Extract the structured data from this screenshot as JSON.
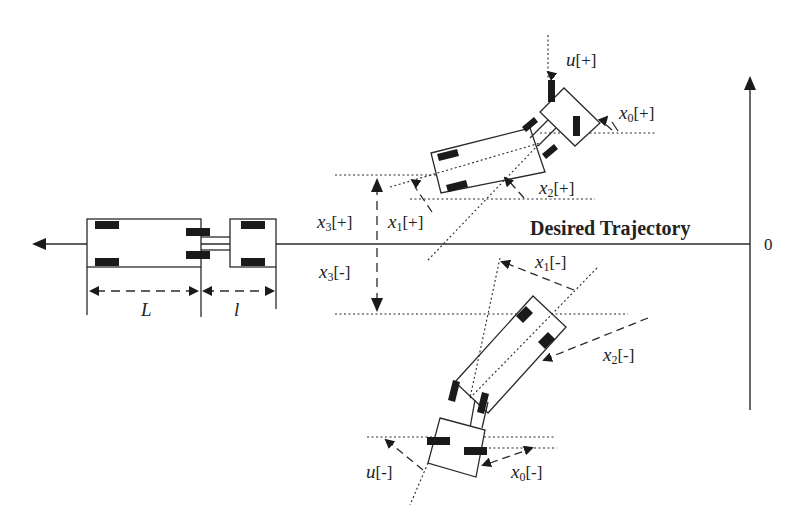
{
  "diagram": {
    "title": "Desired Trajectory",
    "origin_label": "0",
    "colors": {
      "stroke": "#2a2a2a",
      "wheel": "#1a1a1a",
      "background": "#ffffff"
    },
    "dimensions": {
      "trailer_length": "L",
      "hitch_length": "l"
    },
    "labels": {
      "u_pos": {
        "var": "u",
        "sub": "",
        "sign": "[+]"
      },
      "x0_pos": {
        "var": "x",
        "sub": "0",
        "sign": "[+]"
      },
      "x2_pos": {
        "var": "x",
        "sub": "2",
        "sign": "[+]"
      },
      "x3_pos": {
        "var": "x",
        "sub": "3",
        "sign": "[+]"
      },
      "x1_pos": {
        "var": "x",
        "sub": "1",
        "sign": "[+]"
      },
      "x3_neg": {
        "var": "x",
        "sub": "3",
        "sign": "[-]"
      },
      "x1_neg": {
        "var": "x",
        "sub": "1",
        "sign": "[-]"
      },
      "x2_neg": {
        "var": "x",
        "sub": "2",
        "sign": "[-]"
      },
      "u_neg": {
        "var": "u",
        "sub": "",
        "sign": "[-]"
      },
      "x0_neg": {
        "var": "x",
        "sub": "0",
        "sign": "[-]"
      }
    },
    "vehicles": [
      {
        "name": "reference-vehicle",
        "pose": "aligned with desired trajectory"
      },
      {
        "name": "positive-deviation-vehicle",
        "pose": "above trajectory, tilted"
      },
      {
        "name": "negative-deviation-vehicle",
        "pose": "below trajectory, tilted"
      }
    ]
  }
}
